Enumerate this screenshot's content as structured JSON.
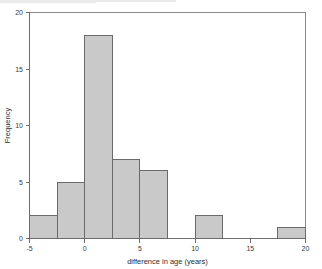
{
  "chart_data": {
    "type": "bar",
    "title": "",
    "subtitle": "",
    "xlabel": "difference in age (years)",
    "ylabel": "Frequency",
    "xlim": [
      -5,
      20
    ],
    "ylim": [
      0,
      20
    ],
    "bin_width": 2.5,
    "grid": false,
    "legend": null,
    "x_ticks": [
      -5,
      0,
      5,
      10,
      15,
      20
    ],
    "x_tick_labels": [
      "-5",
      "0",
      "5",
      "10",
      "15",
      "20"
    ],
    "y_ticks": [
      0,
      5,
      10,
      15,
      20
    ],
    "y_tick_labels": [
      "0",
      "5",
      "10",
      "15",
      "20"
    ],
    "bin_edges": [
      -5,
      -2.5,
      0,
      2.5,
      5,
      7.5,
      10,
      12.5,
      15,
      17.5,
      20
    ],
    "categories": [
      "-5 to -2.5",
      "-2.5 to 0",
      "0 to 2.5",
      "2.5 to 5",
      "5 to 7.5",
      "7.5 to 10",
      "10 to 12.5",
      "12.5 to 15",
      "15 to 17.5",
      "17.5 to 20"
    ],
    "values": [
      2,
      5,
      18,
      7,
      6,
      0,
      2,
      0,
      0,
      1
    ],
    "bars": [
      {
        "x0": -5,
        "x1": -2.5,
        "value": 2
      },
      {
        "x0": -2.5,
        "x1": 0,
        "value": 5
      },
      {
        "x0": 0,
        "x1": 2.5,
        "value": 18
      },
      {
        "x0": 2.5,
        "x1": 5,
        "value": 7
      },
      {
        "x0": 5,
        "x1": 7.5,
        "value": 6
      },
      {
        "x0": 7.5,
        "x1": 10,
        "value": 0
      },
      {
        "x0": 10,
        "x1": 12.5,
        "value": 2
      },
      {
        "x0": 12.5,
        "x1": 15,
        "value": 0
      },
      {
        "x0": 15,
        "x1": 17.5,
        "value": 0
      },
      {
        "x0": 17.5,
        "x1": 20,
        "value": 1
      }
    ],
    "colors": {
      "bar_fill": "#c9c9c9",
      "bar_stroke": "#6a6a6a",
      "axis": "#6e6e6e",
      "frame": "#8a8a8a",
      "text": "#2e2e2e",
      "background": "#ffffff"
    }
  }
}
